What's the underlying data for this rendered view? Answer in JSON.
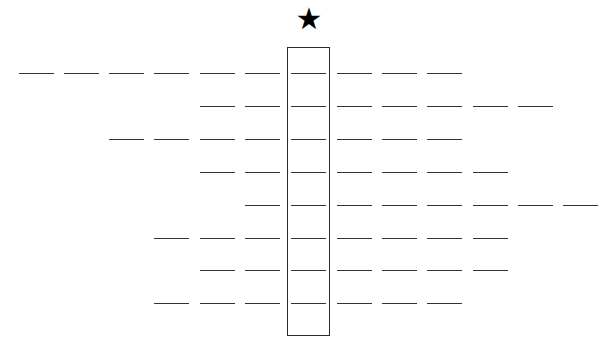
{
  "caption_clipped": "",
  "star": {
    "glyph": "★",
    "icon": "star-icon",
    "column": 6
  },
  "grid": {
    "column_count": 13,
    "column_x": [
      19,
      64,
      109,
      154,
      200,
      245,
      291,
      337,
      382,
      427,
      473,
      518,
      563
    ],
    "dash_width": 35,
    "highlight_column": 6,
    "rows": [
      {
        "y": 74,
        "start_col": 0,
        "end_col": 9,
        "blanks": 10
      },
      {
        "y": 107,
        "start_col": 4,
        "end_col": 11,
        "blanks": 8
      },
      {
        "y": 140,
        "start_col": 2,
        "end_col": 9,
        "blanks": 8
      },
      {
        "y": 173,
        "start_col": 4,
        "end_col": 10,
        "blanks": 7
      },
      {
        "y": 206,
        "start_col": 5,
        "end_col": 12,
        "blanks": 8
      },
      {
        "y": 239,
        "start_col": 3,
        "end_col": 10,
        "blanks": 8
      },
      {
        "y": 271,
        "start_col": 4,
        "end_col": 10,
        "blanks": 7
      },
      {
        "y": 304,
        "start_col": 3,
        "end_col": 9,
        "blanks": 7
      }
    ]
  },
  "colors": {
    "line": "#333333",
    "box_border": "#2b2b2b",
    "star": "#000000",
    "background": "#ffffff"
  }
}
